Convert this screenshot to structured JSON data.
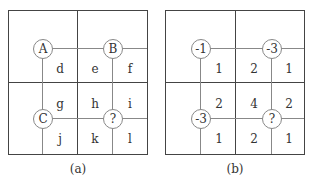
{
  "panels": [
    {
      "id": "a",
      "caption": "(a)",
      "nodes": [
        {
          "label": "A",
          "pos": "top-left"
        },
        {
          "label": "B",
          "pos": "top-right"
        },
        {
          "label": "C",
          "pos": "bottom-left"
        },
        {
          "label": "?",
          "pos": "bottom-right"
        }
      ],
      "cells": {
        "row1": [
          "d",
          "e",
          "f"
        ],
        "row2": [
          "g",
          "h",
          "i"
        ],
        "row3": [
          "j",
          "k",
          "l"
        ]
      }
    },
    {
      "id": "b",
      "caption": "(b)",
      "nodes": [
        {
          "label": "-1",
          "pos": "top-left"
        },
        {
          "label": "-3",
          "pos": "top-right"
        },
        {
          "label": "-3",
          "pos": "bottom-left"
        },
        {
          "label": "?",
          "pos": "bottom-right"
        }
      ],
      "cells": {
        "row1": [
          "1",
          "2",
          "1"
        ],
        "row2": [
          "2",
          "4",
          "2"
        ],
        "row3": [
          "1",
          "2",
          "1"
        ]
      }
    }
  ]
}
